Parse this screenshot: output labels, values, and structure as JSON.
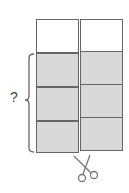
{
  "diagram": {
    "question_label": "?",
    "colors": {
      "shaded": "#d9d9d9",
      "white": "#ffffff",
      "stroke": "#666666"
    },
    "left_strip": {
      "cells": [
        {
          "fill": "white"
        },
        {
          "fill": "shaded"
        },
        {
          "fill": "shaded"
        },
        {
          "fill": "shaded"
        }
      ]
    },
    "right_strip": {
      "cells": [
        {
          "fill": "white"
        },
        {
          "fill": "shaded"
        },
        {
          "fill": "shaded"
        },
        {
          "fill": "shaded"
        }
      ]
    },
    "brace": {
      "spans": "left_strip shaded cells"
    },
    "icon": "scissors-icon"
  }
}
